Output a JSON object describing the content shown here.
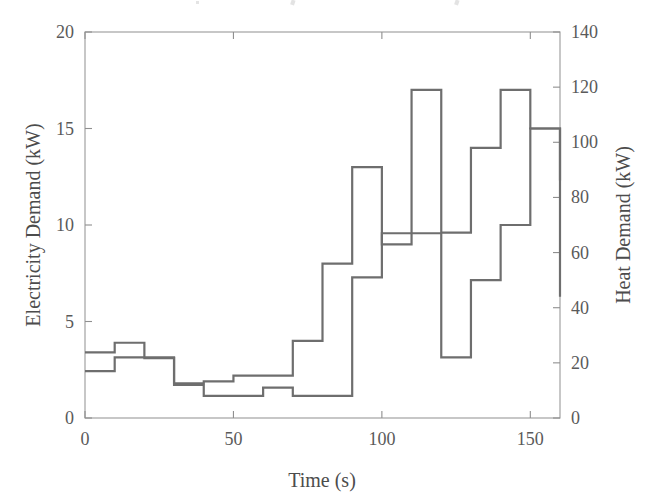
{
  "chart_data": {
    "type": "line",
    "subtype": "step-post",
    "title": "",
    "xlabel": "Time (s)",
    "ylabel": "Electricity Demand (kW)",
    "y2label": "Heat Demand (kW)",
    "xlim": [
      0,
      160
    ],
    "ylim": [
      0,
      20
    ],
    "y2lim": [
      0,
      140
    ],
    "xticks": [
      0,
      50,
      100,
      150
    ],
    "xtick_labels": [
      "0",
      "50",
      "100",
      "150"
    ],
    "yticks": [
      0,
      5,
      10,
      15,
      20
    ],
    "ytick_labels": [
      "0",
      "5",
      "10",
      "15",
      "20"
    ],
    "y2ticks": [
      0,
      20,
      40,
      60,
      80,
      100,
      120,
      140
    ],
    "y2tick_labels": [
      "0",
      "20",
      "40",
      "60",
      "80",
      "100",
      "120",
      "140"
    ],
    "grid": false,
    "legend": "none",
    "line_color": "#6e6e6e",
    "frame_color": "#9a9a9a",
    "x": [
      0,
      10,
      20,
      30,
      40,
      50,
      60,
      70,
      80,
      90,
      100,
      110,
      120,
      130,
      140,
      150,
      160
    ],
    "series": [
      {
        "name": "Electricity Demand",
        "axis": "left",
        "units": "kW",
        "values": [
          3.4,
          3.9,
          3.1,
          1.8,
          1.9,
          2.2,
          2.2,
          4.0,
          8.0,
          13.0,
          9.0,
          17.0,
          9.6,
          14.0,
          17.0,
          15.0,
          12.3
        ]
      },
      {
        "name": "Heat Demand",
        "axis": "right",
        "units": "kW",
        "values_kw": [
          17,
          22,
          22,
          12,
          8,
          8,
          11,
          8,
          8,
          51,
          67,
          67,
          22,
          50,
          70,
          105,
          44
        ],
        "values_left_scale": [
          2.4,
          3.1,
          3.1,
          1.7,
          1.1,
          1.1,
          1.6,
          1.1,
          1.1,
          7.3,
          9.6,
          9.6,
          3.1,
          7.1,
          10.0,
          15.0,
          6.2
        ]
      }
    ]
  },
  "axes": {
    "left_title": "Electricity Demand (kW)",
    "right_title": "Heat Demand (kW)",
    "bottom_title": "Time (s)"
  }
}
